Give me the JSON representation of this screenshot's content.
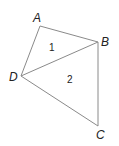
{
  "diagram": {
    "type": "quadrilateral-with-diagonal",
    "vertices": [
      {
        "name": "A",
        "x": 40,
        "y": 26,
        "label_x": 33,
        "label_y": 22
      },
      {
        "name": "B",
        "x": 98,
        "y": 42,
        "label_x": 101,
        "label_y": 46
      },
      {
        "name": "C",
        "x": 98,
        "y": 126,
        "label_x": 96,
        "label_y": 139
      },
      {
        "name": "D",
        "x": 21,
        "y": 76,
        "label_x": 9,
        "label_y": 81
      }
    ],
    "edges": [
      [
        "A",
        "B"
      ],
      [
        "B",
        "C"
      ],
      [
        "C",
        "D"
      ],
      [
        "D",
        "A"
      ],
      [
        "D",
        "B"
      ]
    ],
    "regions": [
      {
        "label": "1",
        "x": 49,
        "y": 51
      },
      {
        "label": "2",
        "x": 67,
        "y": 83
      }
    ],
    "colors": {
      "edge": "#8a8a8a",
      "text": "#222222",
      "background": "#ffffff"
    }
  }
}
